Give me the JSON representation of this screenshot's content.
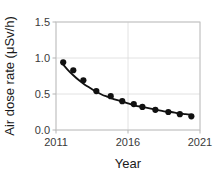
{
  "chart_data": {
    "type": "scatter",
    "title": "",
    "xlabel": "Year",
    "ylabel": "Air dose rate (μSv/h)",
    "xlim": [
      2011,
      2021
    ],
    "ylim": [
      0.0,
      1.5
    ],
    "xticks": [
      2011,
      2016,
      2021
    ],
    "xtick_labels": [
      "2011",
      "2016",
      "2021"
    ],
    "yticks": [
      0.0,
      0.5,
      1.0,
      1.5
    ],
    "ytick_labels": [
      "0.0",
      "0.5",
      "1.0",
      "1.5"
    ],
    "grid": true,
    "legend": "none",
    "marker_color": "#111111",
    "line_color": "#111111",
    "grid_color": "#d8d8d8",
    "frame_color": "#bfbfbf",
    "series": [
      {
        "name": "measured air dose rate",
        "style": "points",
        "x": [
          2011.5,
          2012.2,
          2012.9,
          2013.8,
          2014.8,
          2015.6,
          2016.4,
          2017.0,
          2017.9,
          2018.8,
          2019.6,
          2020.4
        ],
        "y": [
          0.94,
          0.83,
          0.69,
          0.54,
          0.47,
          0.4,
          0.36,
          0.32,
          0.28,
          0.25,
          0.22,
          0.19
        ]
      },
      {
        "name": "fitted decay curve",
        "style": "line",
        "x": [
          2011.45,
          2011.8,
          2012.2,
          2012.6,
          2013.0,
          2013.4,
          2013.8,
          2014.2,
          2014.6,
          2015.0,
          2015.5,
          2016.0,
          2016.5,
          2017.0,
          2017.5,
          2018.0,
          2018.5,
          2019.0,
          2019.5,
          2020.0,
          2020.45
        ],
        "y": [
          0.92,
          0.84,
          0.76,
          0.69,
          0.63,
          0.58,
          0.53,
          0.49,
          0.46,
          0.43,
          0.4,
          0.37,
          0.34,
          0.32,
          0.3,
          0.28,
          0.26,
          0.25,
          0.23,
          0.22,
          0.21
        ]
      }
    ]
  },
  "axes": {
    "y_axis_title": "Air dose rate (μSv/h)",
    "x_axis_title": "Year"
  }
}
